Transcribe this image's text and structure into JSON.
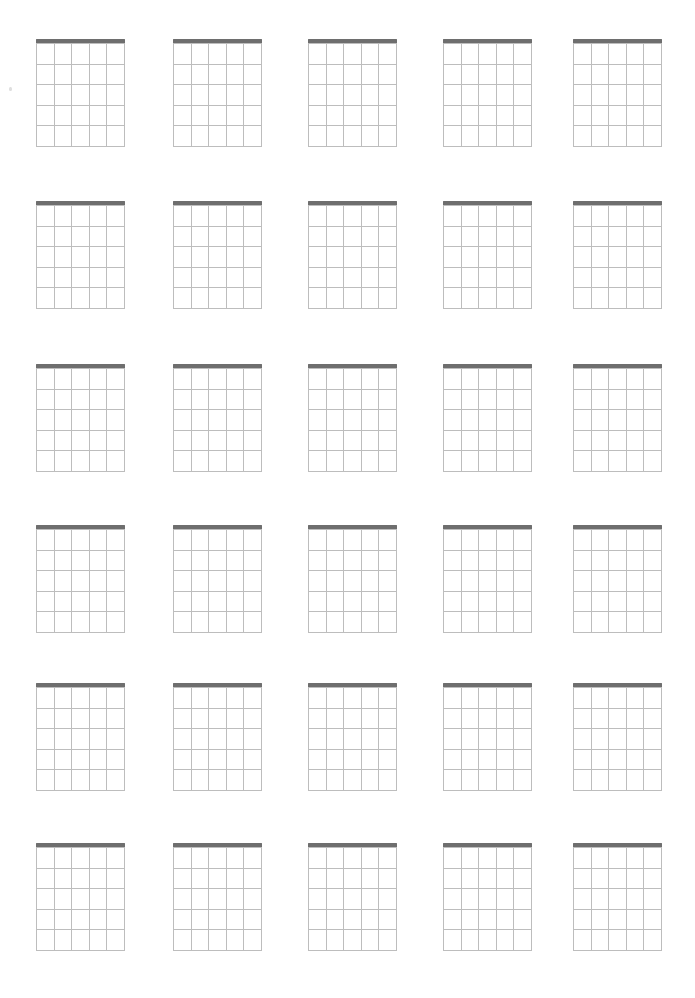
{
  "page": {
    "background_color": "#ffffff",
    "width": 695,
    "height": 998
  },
  "sheet": {
    "columns": 5,
    "rows": 6,
    "total_diagrams": 30,
    "column_x": [
      0,
      137,
      272,
      407,
      537
    ],
    "row_y": [
      0,
      162,
      325,
      486,
      644,
      804
    ]
  },
  "diagram": {
    "label": "blank chord diagram",
    "width": 89,
    "height": 107,
    "strings": 6,
    "frets": 5,
    "string_labels": [
      "E",
      "A",
      "D",
      "G",
      "B",
      "e"
    ],
    "fret_numbers": [
      "1",
      "2",
      "3",
      "4",
      "5"
    ],
    "nut": {
      "name": "nut",
      "thickness": 4,
      "color": "#6e6e6e"
    },
    "grid_line_color": "#bdbdbd",
    "string_x": [
      0,
      17.6,
      35.2,
      52.8,
      70.4,
      88
    ],
    "fret_y": [
      0,
      20.6,
      41.2,
      61.8,
      82.4,
      103
    ]
  },
  "artifacts": {
    "speck": {
      "name": "scan-speck",
      "color": "#d9d9d9"
    }
  }
}
